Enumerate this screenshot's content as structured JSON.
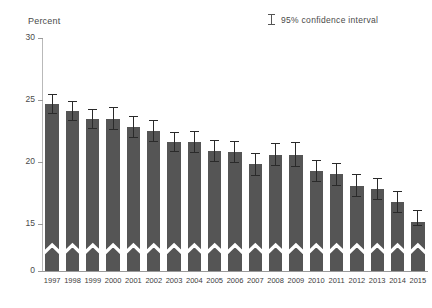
{
  "chart_data": {
    "type": "bar",
    "title": "",
    "subtitle": "",
    "xlabel": "",
    "ylabel": "Percent",
    "ylim": [
      0,
      30
    ],
    "yticks": [
      0,
      15,
      20,
      25,
      30
    ],
    "ytick_labels": [
      "0",
      "15",
      "20",
      "25",
      "30"
    ],
    "axis_break": true,
    "axis_break_note": "y-axis broken between 0 and 15 (zigzag)",
    "grid": false,
    "legend_position": "top-right",
    "legend": [
      {
        "label": "95% confidence interval",
        "marker": "error-bar"
      }
    ],
    "categories": [
      "1997",
      "1998",
      "1999",
      "2000",
      "2001",
      "2002",
      "2003",
      "2004",
      "2005",
      "2006",
      "2007",
      "2008",
      "2009",
      "2010",
      "2011",
      "2012",
      "2013",
      "2014",
      "2015"
    ],
    "values": [
      24.7,
      24.1,
      23.5,
      23.5,
      22.8,
      22.5,
      21.6,
      21.6,
      20.9,
      20.8,
      19.8,
      20.6,
      20.6,
      19.3,
      19.0,
      18.1,
      17.8,
      16.8,
      15.2
    ],
    "ci_low": [
      23.9,
      23.3,
      22.7,
      22.6,
      21.9,
      21.6,
      20.8,
      20.7,
      20.0,
      19.9,
      18.9,
      19.7,
      19.6,
      18.4,
      18.1,
      17.2,
      16.9,
      15.9,
      14.3
    ],
    "ci_high": [
      25.5,
      24.9,
      24.3,
      24.4,
      23.7,
      23.4,
      22.4,
      22.5,
      21.8,
      21.7,
      20.7,
      21.5,
      21.6,
      20.2,
      19.9,
      19.0,
      18.7,
      17.7,
      16.1
    ],
    "bar_color": "#555555",
    "error_color": "#2a2a2a",
    "axis_color": "#9a9a9a"
  },
  "legend": {
    "ci_label": "95% confidence interval"
  },
  "axis": {
    "y_title": "Percent"
  }
}
